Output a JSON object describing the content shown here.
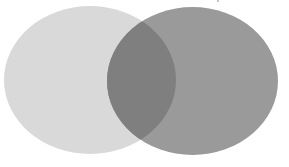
{
  "diagram": {
    "type": "venn",
    "sets": [
      {
        "id": "set-a",
        "label": "",
        "color": "#d9d9d9"
      },
      {
        "id": "set-b",
        "label": "",
        "color": "#9a9a9a"
      }
    ],
    "intersection": {
      "label": "",
      "color": "#7f7f7f"
    },
    "background": "#ffffff"
  }
}
